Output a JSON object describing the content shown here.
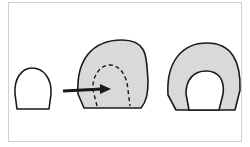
{
  "diagram": {
    "colors": {
      "fill": "#d9d9d9",
      "stroke": "#1a1a1a",
      "background": "#ffffff",
      "border": "#d0d0d0"
    },
    "shapes": [
      {
        "id": "small-shape",
        "style": "outline"
      },
      {
        "id": "expanded-shape",
        "style": "shaded",
        "inner": "dashed-outline"
      },
      {
        "id": "final-shape",
        "style": "shaded",
        "inner": "white-opening"
      }
    ],
    "arrow": {
      "direction": "right"
    }
  }
}
